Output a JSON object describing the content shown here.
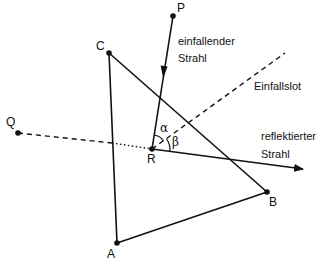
{
  "diagram": {
    "points": {
      "P": {
        "label": "P",
        "x": 173,
        "y": 16
      },
      "C": {
        "label": "C",
        "x": 109,
        "y": 53
      },
      "Q": {
        "label": "Q",
        "x": 18,
        "y": 133
      },
      "R": {
        "label": "R",
        "x": 152,
        "y": 149
      },
      "B": {
        "label": "B",
        "x": 267,
        "y": 192
      },
      "A": {
        "label": "A",
        "x": 117,
        "y": 243
      }
    },
    "labels": {
      "incident_1": "einfallender",
      "incident_2": "Strahl",
      "normal": "Einfallslot",
      "reflected_1": "reflektierter",
      "reflected_2": "Strahl",
      "alpha": "α",
      "beta": "β"
    },
    "colors": {
      "ink": "#111111",
      "background": "#ffffff"
    }
  }
}
